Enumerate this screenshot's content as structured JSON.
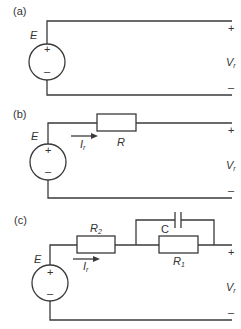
{
  "panels": {
    "a": {
      "label": "(a)",
      "source_label": "E",
      "plus_inner": "+",
      "minus_inner": "–",
      "out_plus": "+",
      "out_minus": "–",
      "voltage": "V",
      "voltage_sub": "r"
    },
    "b": {
      "label": "(b)",
      "source_label": "E",
      "plus_inner": "+",
      "minus_inner": "–",
      "current": "I",
      "current_sub": "r",
      "resistor": "R",
      "out_plus": "+",
      "out_minus": "–",
      "voltage": "V",
      "voltage_sub": "r"
    },
    "c": {
      "label": "(c)",
      "source_label": "E",
      "plus_inner": "+",
      "minus_inner": "–",
      "current": "I",
      "current_sub": "r",
      "resistor2": "R",
      "resistor2_sub": "2",
      "resistor1": "R",
      "resistor1_sub": "1",
      "capacitor": "C",
      "out_plus": "+",
      "out_minus": "–",
      "voltage": "V",
      "voltage_sub": "r"
    }
  }
}
